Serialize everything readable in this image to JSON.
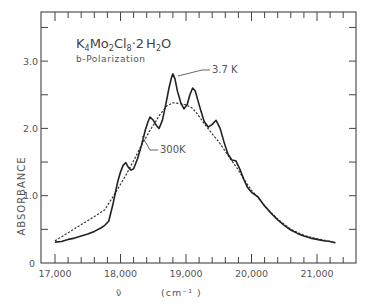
{
  "chart_data": {
    "type": "line",
    "title": "K4Mo2Cl8·2H2O",
    "title_parts": {
      "K": "K",
      "k_sub": "4",
      "Mo": "Mo",
      "mo_sub": "2",
      "Cl": "Cl",
      "cl_sub": "8",
      "dot": "·2",
      "H": "H",
      "h_sub": "2",
      "O": "O"
    },
    "subtitle": "b-Polarization",
    "xlabel": "ν̃",
    "xlabel_units": "(cm⁻¹ )",
    "ylabel": "ABSORBANCE",
    "xlim": [
      16780,
      21600
    ],
    "ylim": [
      0,
      3.73
    ],
    "x_ticks": [
      17000,
      18000,
      19000,
      20000,
      21000
    ],
    "x_tick_labels": [
      "17,000",
      "18,000",
      "19,000",
      "20,000",
      "21,000"
    ],
    "x_minor_step": 200,
    "y_ticks": [
      0,
      1.0,
      2.0,
      3.0
    ],
    "y_tick_labels": [
      "0",
      "1.0",
      "2.0",
      "3.0"
    ],
    "y_minor_step": 0.5,
    "grid": false,
    "legend": "inline annotations",
    "series": [
      {
        "name": "3.7 K",
        "style": "solid",
        "x": [
          17000,
          17100,
          17200,
          17300,
          17400,
          17500,
          17600,
          17700,
          17760,
          17820,
          17880,
          17920,
          17960,
          18000,
          18040,
          18080,
          18120,
          18160,
          18200,
          18260,
          18320,
          18380,
          18420,
          18450,
          18500,
          18550,
          18590,
          18640,
          18690,
          18740,
          18780,
          18800,
          18830,
          18870,
          18920,
          18970,
          19020,
          19060,
          19100,
          19140,
          19180,
          19230,
          19280,
          19340,
          19400,
          19460,
          19520,
          19580,
          19640,
          19700,
          19760,
          19820,
          19880,
          19940,
          20000,
          20100,
          20190,
          20300,
          20400,
          20500,
          20600,
          20700,
          20800,
          20900,
          21000,
          21100,
          21200,
          21280
        ],
        "values": [
          0.31,
          0.32,
          0.35,
          0.37,
          0.4,
          0.43,
          0.47,
          0.52,
          0.56,
          0.62,
          0.85,
          1.04,
          1.22,
          1.35,
          1.45,
          1.49,
          1.42,
          1.38,
          1.4,
          1.55,
          1.75,
          1.98,
          2.1,
          2.17,
          2.12,
          2.04,
          2.0,
          2.12,
          2.35,
          2.6,
          2.76,
          2.81,
          2.74,
          2.55,
          2.38,
          2.29,
          2.36,
          2.5,
          2.6,
          2.56,
          2.42,
          2.25,
          2.1,
          2.02,
          2.06,
          2.12,
          2.0,
          1.8,
          1.62,
          1.53,
          1.52,
          1.4,
          1.25,
          1.12,
          1.05,
          0.98,
          0.86,
          0.74,
          0.64,
          0.56,
          0.49,
          0.44,
          0.4,
          0.37,
          0.35,
          0.33,
          0.32,
          0.3
        ]
      },
      {
        "name": "300 K",
        "style": "dotted",
        "x": [
          17000,
          17200,
          17400,
          17600,
          17760,
          17920,
          18080,
          18200,
          18320,
          18450,
          18600,
          18700,
          18800,
          18900,
          19000,
          19100,
          19200,
          19300,
          19400,
          19500,
          19600,
          19700,
          19800,
          19900,
          20000,
          20100,
          20200,
          20400,
          20600,
          20800,
          21000,
          21200,
          21280
        ],
        "values": [
          0.33,
          0.45,
          0.57,
          0.69,
          0.79,
          1.04,
          1.3,
          1.52,
          1.75,
          1.97,
          2.2,
          2.33,
          2.38,
          2.37,
          2.35,
          2.3,
          2.18,
          2.04,
          1.92,
          1.8,
          1.66,
          1.52,
          1.38,
          1.22,
          1.08,
          0.97,
          0.85,
          0.65,
          0.5,
          0.41,
          0.36,
          0.32,
          0.3
        ]
      }
    ],
    "annotations": [
      {
        "text": "3.7 K",
        "x_px": 212,
        "y_px": 73,
        "leader_to": [
          178,
          76
        ]
      },
      {
        "text": "300K",
        "x_px": 160,
        "y_px": 153,
        "leader_to": [
          142,
          136
        ]
      }
    ]
  }
}
